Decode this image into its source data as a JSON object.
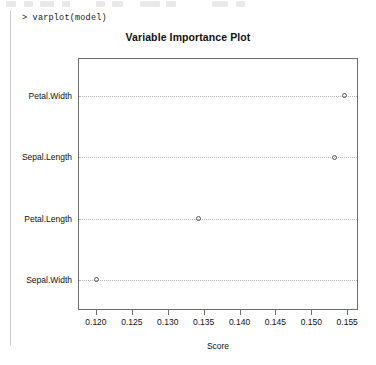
{
  "console": {
    "prompt_line": "> varplot(model)"
  },
  "toolbar": {
    "items": [
      {
        "name": "toolbar-icon-1",
        "left": 6,
        "width": 10
      },
      {
        "name": "toolbar-icon-2",
        "left": 24,
        "width": 9
      },
      {
        "name": "toolbar-icon-3",
        "left": 40,
        "width": 14
      },
      {
        "name": "toolbar-icon-4",
        "left": 62,
        "width": 8
      },
      {
        "name": "toolbar-icon-5",
        "left": 96,
        "width": 9
      },
      {
        "name": "toolbar-icon-6",
        "left": 112,
        "width": 11
      },
      {
        "name": "toolbar-icon-7",
        "left": 140,
        "width": 20
      },
      {
        "name": "toolbar-icon-8",
        "left": 166,
        "width": 10
      },
      {
        "name": "toolbar-icon-9",
        "left": 212,
        "width": 16
      },
      {
        "name": "toolbar-icon-10",
        "left": 236,
        "width": 9
      }
    ]
  },
  "chart_data": {
    "type": "scatter",
    "title": "Variable Importance Plot",
    "xlabel": "Score",
    "ylabel": "",
    "orientation": "horizontal",
    "grid": true,
    "grid_style": "dotted",
    "legend": null,
    "marker": "open-circle",
    "xlim": [
      0.1175,
      0.1565
    ],
    "xticks": [
      0.12,
      0.125,
      0.13,
      0.135,
      0.14,
      0.145,
      0.15,
      0.155
    ],
    "xtick_labels": [
      "0.120",
      "0.125",
      "0.130",
      "0.135",
      "0.140",
      "0.145",
      "0.150",
      "0.155"
    ],
    "categories": [
      "Sepal.Width",
      "Petal.Length",
      "Sepal.Length",
      "Petal.Width"
    ],
    "points": [
      {
        "label": "Petal.Width",
        "value": 0.1545
      },
      {
        "label": "Sepal.Length",
        "value": 0.1531
      },
      {
        "label": "Petal.Length",
        "value": 0.1341
      },
      {
        "label": "Sepal.Width",
        "value": 0.12
      }
    ],
    "values": [
      0.12,
      0.1341,
      0.1531,
      0.1545
    ],
    "colors": {
      "marker_stroke": "#555555",
      "grid": "#b4b4b4",
      "axis": "#6e6e6e",
      "text": "#111111",
      "background": "#ffffff"
    }
  }
}
